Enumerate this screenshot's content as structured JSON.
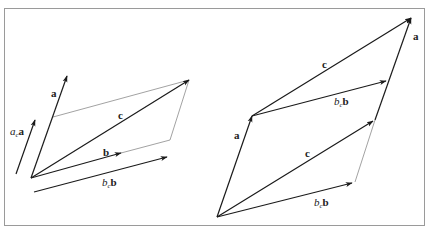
{
  "figure": {
    "left_panel": {
      "labels": {
        "a": "a",
        "ac_coef": "a",
        "ac_sub": "c",
        "ac_vec": "a",
        "c": "c",
        "b": "b",
        "bc_coef": "b",
        "bc_sub": "c",
        "bc_vec": "b"
      }
    },
    "right_panel": {
      "labels": {
        "a_left": "a",
        "a_right": "a",
        "c_top": "c",
        "c_bottom": "c",
        "bc_top_coef": "b",
        "bc_top_sub": "c",
        "bc_top_vec": "b",
        "bc_bottom_coef": "b",
        "bc_bottom_sub": "c",
        "bc_bottom_vec": "b"
      }
    },
    "colors": {
      "stroke": "#1a1a1a",
      "construction": "#8a8a8a",
      "frame": "#9a9a9a"
    }
  }
}
